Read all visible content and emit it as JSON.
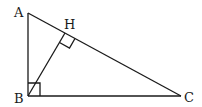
{
  "diagram": {
    "type": "right-triangle-with-altitude",
    "points": {
      "A": {
        "label": "A",
        "x": 28,
        "y": 13
      },
      "B": {
        "label": "B",
        "x": 28,
        "y": 96
      },
      "C": {
        "label": "C",
        "x": 181,
        "y": 96
      },
      "H": {
        "label": "H",
        "x": 65,
        "y": 33
      }
    },
    "segments": [
      "AB",
      "BC",
      "AC",
      "BH"
    ],
    "right_angles": [
      "B",
      "H"
    ],
    "stroke_color": "#1a1a1a"
  }
}
